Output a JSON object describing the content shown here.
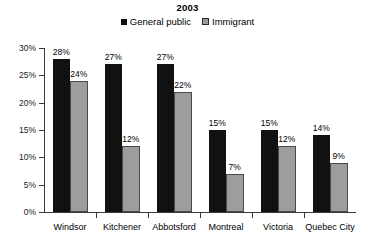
{
  "chart_data": {
    "type": "bar",
    "title": "2003",
    "xlabel": "",
    "ylabel": "",
    "ylim": [
      0,
      30
    ],
    "ytick_labels": [
      "0%",
      "5%",
      "10%",
      "15%",
      "20%",
      "25%",
      "30%"
    ],
    "ytick_values": [
      0,
      5,
      10,
      15,
      20,
      25,
      30
    ],
    "grid": false,
    "legend_position": "top-center",
    "value_suffix": "%",
    "categories": [
      "Windsor",
      "Kitchener",
      "Abbotsford",
      "Montreal",
      "Victoria",
      "Quebec City"
    ],
    "series": [
      {
        "name": "General public",
        "color": "#111111",
        "values": [
          28,
          27,
          27,
          15,
          15,
          14
        ],
        "labels": [
          "28%",
          "27%",
          "27%",
          "15%",
          "15%",
          "14%"
        ]
      },
      {
        "name": "Immigrant",
        "color": "#9d9d9d",
        "values": [
          24,
          12,
          22,
          7,
          12,
          9
        ],
        "labels": [
          "24%",
          "12%",
          "22%",
          "7%",
          "12%",
          "9%"
        ]
      }
    ]
  }
}
